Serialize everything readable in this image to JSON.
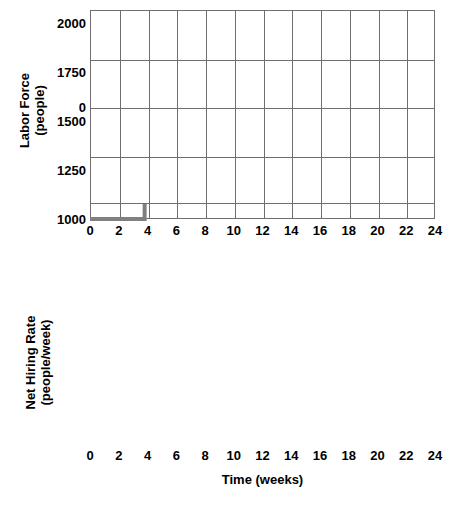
{
  "figure": {
    "line_color": "#808080",
    "grid_color": "#6e6e6e",
    "background": "#ffffff"
  },
  "panels": {
    "labor_force": {
      "ylabel_line1": "Labor Force",
      "ylabel_line2": "(people)",
      "yticks": [
        "1000",
        "1250",
        "1500",
        "1750",
        "2000"
      ],
      "xticks": [
        "0",
        "2",
        "4",
        "6",
        "8",
        "10",
        "12",
        "14",
        "16",
        "18",
        "20",
        "22",
        "24"
      ],
      "annotation": "Desired Labor Force"
    },
    "hiring_rate": {
      "ylabel_line1": "Net Hiring Rate",
      "ylabel_line2": "(people/week)",
      "yticks": [
        "0"
      ],
      "xticks": [
        "0",
        "2",
        "4",
        "6",
        "8",
        "10",
        "12",
        "14",
        "16",
        "18",
        "20",
        "22",
        "24"
      ],
      "xlabel": "Time (weeks)"
    }
  },
  "chart_data": [
    {
      "type": "line",
      "title": "",
      "xlabel": "",
      "ylabel": "Labor Force (people)",
      "xlim": [
        0,
        24
      ],
      "ylim": [
        1000,
        2025
      ],
      "xticks": [
        0,
        2,
        4,
        6,
        8,
        10,
        12,
        14,
        16,
        18,
        20,
        22,
        24
      ],
      "yticks": [
        1000,
        1250,
        1500,
        1750,
        2000
      ],
      "grid": true,
      "legend": "none",
      "annotations": [
        {
          "text": "Desired Labor Force",
          "points_to_x": 12,
          "points_to_y": 1800
        }
      ],
      "series": [
        {
          "name": "Desired Labor Force",
          "style": "step",
          "color": "#808080",
          "x": [
            0,
            3.8,
            3.8,
            12,
            12,
            24
          ],
          "values": [
            1000,
            1000,
            2000,
            2000,
            1500,
            1500
          ]
        }
      ]
    },
    {
      "type": "line",
      "title": "",
      "xlabel": "Time (weeks)",
      "ylabel": "Net Hiring Rate (people/week)",
      "xlim": [
        0,
        24
      ],
      "ylim": [
        -2,
        2
      ],
      "xticks": [
        0,
        2,
        4,
        6,
        8,
        10,
        12,
        14,
        16,
        18,
        20,
        22,
        24
      ],
      "yticks": [
        0
      ],
      "grid": true,
      "legend": "none",
      "series": []
    }
  ]
}
